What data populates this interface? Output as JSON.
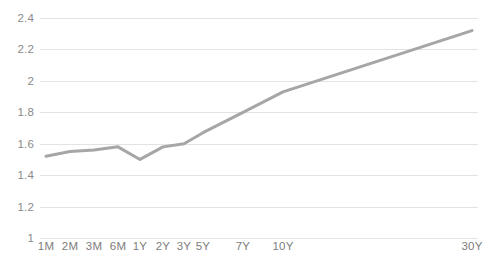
{
  "chart_data": {
    "type": "line",
    "title": "",
    "subtitle": "",
    "xlabel": "",
    "ylabel": "",
    "categories": [
      "1M",
      "2M",
      "3M",
      "6M",
      "1Y",
      "2Y",
      "3Y",
      "5Y",
      "7Y",
      "10Y",
      "30Y"
    ],
    "values": [
      1.52,
      1.55,
      1.56,
      1.58,
      1.5,
      1.58,
      1.6,
      1.67,
      1.8,
      1.93,
      2.32
    ],
    "series": [
      {
        "name": "",
        "values": [
          1.52,
          1.55,
          1.56,
          1.58,
          1.5,
          1.58,
          1.6,
          1.67,
          1.8,
          1.93,
          2.32
        ]
      }
    ],
    "ylim": [
      1,
      2.4
    ],
    "ytick_labels": [
      "2.4",
      "2.2",
      "2",
      "1.8",
      "1.6",
      "1.4",
      "1.2",
      "1"
    ],
    "ytick_values": [
      2.4,
      2.2,
      2,
      1.8,
      1.6,
      1.4,
      1.2,
      1
    ],
    "category_positions_px": [
      46,
      70,
      94,
      118,
      140,
      163,
      184,
      203,
      243,
      283,
      472
    ],
    "grid": "horizontal-only",
    "legend": "none",
    "line_color": "#a6a6a6",
    "gridline_color": "#e3e3e3",
    "background_color": "#ffffff",
    "tick_label_color": "#8a8a8a",
    "annotations": []
  }
}
